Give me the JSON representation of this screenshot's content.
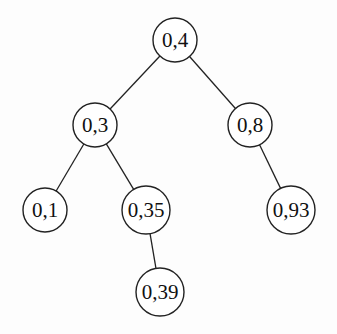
{
  "diagram": {
    "type": "binary-search-tree",
    "nodes": [
      {
        "id": "n04",
        "label": "0,4",
        "x": 175,
        "y": 40,
        "r": 22
      },
      {
        "id": "n03",
        "label": "0,3",
        "x": 95,
        "y": 125,
        "r": 22
      },
      {
        "id": "n08",
        "label": "0,8",
        "x": 250,
        "y": 125,
        "r": 22
      },
      {
        "id": "n01",
        "label": "0,1",
        "x": 45,
        "y": 210,
        "r": 22
      },
      {
        "id": "n035",
        "label": "0,35",
        "x": 146,
        "y": 210,
        "r": 24
      },
      {
        "id": "n093",
        "label": "0,93",
        "x": 291,
        "y": 210,
        "r": 24
      },
      {
        "id": "n039",
        "label": "0,39",
        "x": 160,
        "y": 292,
        "r": 24
      }
    ],
    "edges": [
      {
        "from": "n04",
        "to": "n03"
      },
      {
        "from": "n04",
        "to": "n08"
      },
      {
        "from": "n03",
        "to": "n01"
      },
      {
        "from": "n03",
        "to": "n035"
      },
      {
        "from": "n08",
        "to": "n093"
      },
      {
        "from": "n035",
        "to": "n039"
      }
    ]
  }
}
